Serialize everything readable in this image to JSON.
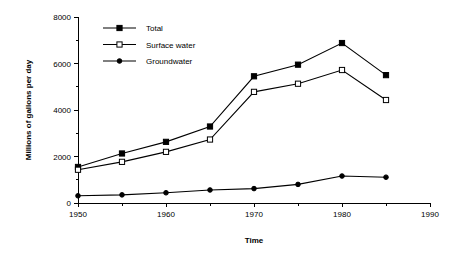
{
  "chart_data": {
    "type": "line",
    "title": "",
    "xlabel": "Time",
    "ylabel": "Millions of gallons per day",
    "x": [
      1950,
      1955,
      1960,
      1965,
      1970,
      1975,
      1980,
      1985
    ],
    "xlim": [
      1950,
      1990
    ],
    "ylim": [
      0,
      8000
    ],
    "xticks": [
      1950,
      1960,
      1970,
      1980,
      1990
    ],
    "xticklabels": [
      "1950",
      "1960",
      "1970",
      "1980",
      "1990"
    ],
    "xminorticks": [
      1955,
      1965,
      1975,
      1985
    ],
    "yticks": [
      0,
      2000,
      4000,
      6000,
      8000
    ],
    "yticklabels": [
      "0",
      "2000",
      "4000",
      "6000",
      "8000"
    ],
    "yminorticks": [
      1000,
      3000,
      5000,
      7000
    ],
    "grid": false,
    "legend_position": "upper left",
    "series": [
      {
        "name": "Total",
        "marker": "filled-square",
        "values": [
          1550,
          2130,
          2630,
          3290,
          5450,
          5950,
          6880,
          5500
        ]
      },
      {
        "name": "Surface water",
        "marker": "open-square",
        "values": [
          1430,
          1770,
          2200,
          2730,
          4780,
          5130,
          5720,
          4430
        ]
      },
      {
        "name": "Groundwater",
        "marker": "filled-circle",
        "values": [
          310,
          350,
          440,
          560,
          620,
          800,
          1160,
          1110
        ]
      }
    ]
  },
  "legend": {
    "entries": [
      {
        "label": "Total"
      },
      {
        "label": "Surface water"
      },
      {
        "label": "Groundwater"
      }
    ]
  },
  "colors": {
    "axis": "#000000",
    "series": "#000000",
    "background": "#ffffff"
  }
}
